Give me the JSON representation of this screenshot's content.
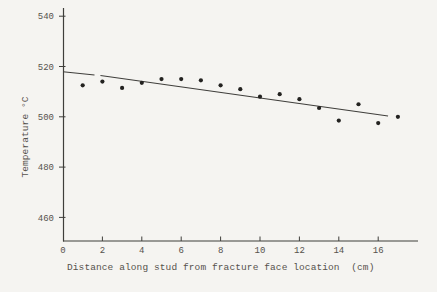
{
  "figure": {
    "background": "#f5f4f1",
    "ink_color": "#3f3e3b",
    "text_color": "#55524d",
    "dot_color": "#232220"
  },
  "chart_data": {
    "type": "scatter",
    "title": "",
    "xlabel": "Distance along stud from fracture face location  (cm)",
    "ylabel": "Temperature °C",
    "x_ticks": [
      0,
      2,
      4,
      6,
      8,
      10,
      12,
      14,
      16
    ],
    "y_ticks": [
      540,
      520,
      500,
      480,
      460
    ],
    "xlim": [
      0,
      18
    ],
    "ylim": [
      450,
      543
    ],
    "grid": false,
    "legend_position": "none",
    "x": [
      1,
      2,
      3,
      4,
      5,
      6,
      7,
      8,
      9,
      10,
      11,
      12,
      13,
      14,
      15,
      16,
      17
    ],
    "y": [
      512.5,
      514,
      511.5,
      513.5,
      515,
      515,
      514.5,
      512.5,
      511,
      508,
      509,
      507,
      503.5,
      498.5,
      505,
      497.5,
      500
    ],
    "trend_line": {
      "type": "linear",
      "segments": [
        {
          "x1": 0,
          "y1": 517.9,
          "x2": 1.6,
          "y2": 516.6
        },
        {
          "x1": 1.9,
          "y1": 516.4,
          "x2": 16.5,
          "y2": 500.3
        }
      ]
    }
  }
}
